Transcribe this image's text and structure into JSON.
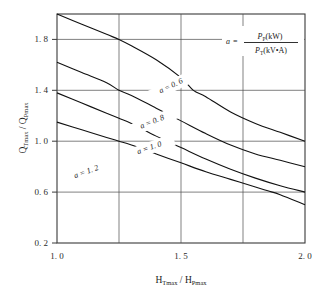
{
  "chart_data": {
    "type": "line",
    "title": "",
    "xlabel": "H_Tmax / H_Pmax",
    "ylabel": "Q_Tmax / Q_Pmax",
    "xlim": [
      1.0,
      2.0
    ],
    "ylim": [
      0.2,
      2.0
    ],
    "grid": true,
    "legend_position": "inline-curve-labels",
    "x_ticks_labeled": [
      "1. 0",
      "1. 5",
      "2. 0"
    ],
    "x_tick_values": [
      1.0,
      1.5,
      2.0
    ],
    "x_gridline_values": [
      1.25,
      1.5,
      1.75
    ],
    "y_ticks_labeled": [
      "1. 8",
      "1. 4",
      "1. 0",
      "0. 6",
      "0. 2"
    ],
    "y_tick_values": [
      1.8,
      1.4,
      1.0,
      0.6,
      0.2
    ],
    "series": [
      {
        "name": "a = 0. 6",
        "a": 0.6,
        "label_text": "a = 0. 6",
        "x": [
          1.0,
          1.1,
          1.2,
          1.25,
          1.3,
          1.4,
          1.5,
          1.55,
          1.6,
          1.7,
          1.8,
          1.9,
          2.0
        ],
        "values": [
          2.0,
          1.92,
          1.84,
          1.8,
          1.75,
          1.64,
          1.5,
          1.4,
          1.35,
          1.23,
          1.14,
          1.07,
          1.0
        ]
      },
      {
        "name": "a = 0. 8",
        "a": 0.8,
        "label_text": "a = 0. 8",
        "x": [
          1.0,
          1.1,
          1.2,
          1.25,
          1.3,
          1.4,
          1.5,
          1.6,
          1.7,
          1.8,
          1.9,
          2.0
        ],
        "values": [
          1.62,
          1.54,
          1.46,
          1.4,
          1.36,
          1.26,
          1.16,
          1.06,
          0.97,
          0.9,
          0.85,
          0.8
        ]
      },
      {
        "name": "a = 1. 0",
        "a": 1.0,
        "label_text": "a = 1. 0",
        "x": [
          1.0,
          1.1,
          1.2,
          1.25,
          1.3,
          1.4,
          1.5,
          1.6,
          1.7,
          1.8,
          1.9,
          2.0
        ],
        "values": [
          1.38,
          1.3,
          1.22,
          1.18,
          1.14,
          1.04,
          0.95,
          0.86,
          0.78,
          0.71,
          0.65,
          0.6
        ]
      },
      {
        "name": "a = 1. 2",
        "a": 1.2,
        "label_text": "a = 1. 2",
        "x": [
          1.0,
          1.1,
          1.2,
          1.25,
          1.3,
          1.4,
          1.5,
          1.6,
          1.7,
          1.8,
          1.85,
          1.9,
          2.0
        ],
        "values": [
          1.15,
          1.09,
          1.03,
          1.0,
          0.97,
          0.9,
          0.83,
          0.76,
          0.7,
          0.64,
          0.61,
          0.58,
          0.5
        ]
      }
    ],
    "annotation": {
      "lhs": "a",
      "equals": "=",
      "numerator_main": "P",
      "numerator_sub": "P",
      "numerator_unit": "(kW)",
      "denominator_main": "P",
      "denominator_sub": "T",
      "denominator_unit": "(kV•A)"
    },
    "axis_label_parts": {
      "y_main_1": "Q",
      "y_sub_1": "Tmax",
      "y_slash": "/",
      "y_main_2": "Q",
      "y_sub_2": "Pmax",
      "x_main_1": "H",
      "x_sub_1": "Tmax",
      "x_slash": "/",
      "x_main_2": "H",
      "x_sub_2": "Pmax"
    },
    "colors": {
      "curve": "#111111",
      "grid": "#4a4a4a",
      "frame": "#3a3a3a",
      "background": "#ffffff",
      "text": "#1a1a1a"
    }
  }
}
